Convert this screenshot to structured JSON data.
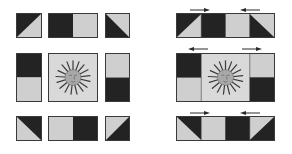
{
  "colors": {
    "dark": "#232323",
    "light": "#cfcfcf",
    "border": "#3a3a3a",
    "sun_bg": "#d9d9d9",
    "sun_rays": "#3b3b3b",
    "sun_face": "#a8a8a8",
    "arrow": "#2a2a2a"
  },
  "left_panel": {
    "description": "Block units laid out separately",
    "rows": [
      {
        "row": 1,
        "pieces": [
          "hst-dark-upper-left",
          "rectangle-dark-left-light-right",
          "hst-dark-lower-left"
        ]
      },
      {
        "row": 2,
        "pieces": [
          "column-dark-top-light-bottom",
          "sun-center-block",
          "column-light-top-dark-bottom"
        ]
      },
      {
        "row": 3,
        "pieces": [
          "hst-dark-upper-right",
          "rectangle-light-left-dark-right",
          "hst-dark-lower-right"
        ]
      }
    ]
  },
  "right_panel": {
    "description": "Units sewn into rows with pressing direction arrows",
    "rows": [
      {
        "row": 1,
        "arrows": [
          "right",
          "left"
        ]
      },
      {
        "row": 2,
        "arrows": [
          "left",
          "right"
        ]
      },
      {
        "row": 3,
        "arrows": [
          "right",
          "left"
        ]
      }
    ]
  }
}
